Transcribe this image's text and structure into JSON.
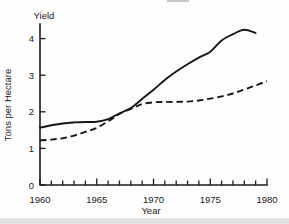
{
  "figure": {
    "background": "#fdfdfd",
    "bottom_strip_color": "#e3e3e3"
  },
  "chart_data": {
    "type": "line",
    "title": "Yield",
    "xlabel": "Year",
    "ylabel": "Tons per Hectare",
    "xlim": [
      1960,
      1980
    ],
    "ylim": [
      0,
      4.4
    ],
    "x_major_ticks": [
      1960,
      1965,
      1970,
      1975,
      1980
    ],
    "x_minor_tick_step": 1,
    "y_ticks": [
      0,
      1,
      2,
      3,
      4
    ],
    "grid": false,
    "legend": "none",
    "line_color": "#161616",
    "series": [
      {
        "name": "solid",
        "line_style": "solid",
        "points": [
          [
            1960,
            1.57
          ],
          [
            1961,
            1.63
          ],
          [
            1962,
            1.68
          ],
          [
            1963,
            1.71
          ],
          [
            1964,
            1.72
          ],
          [
            1965,
            1.73
          ],
          [
            1966,
            1.8
          ],
          [
            1967,
            1.96
          ],
          [
            1968,
            2.1
          ],
          [
            1969,
            2.35
          ],
          [
            1970,
            2.6
          ],
          [
            1971,
            2.87
          ],
          [
            1972,
            3.1
          ],
          [
            1973,
            3.3
          ],
          [
            1974,
            3.48
          ],
          [
            1975,
            3.64
          ],
          [
            1976,
            3.95
          ],
          [
            1977,
            4.12
          ],
          [
            1978,
            4.24
          ],
          [
            1979,
            4.15
          ]
        ]
      },
      {
        "name": "dashed",
        "line_style": "dashed",
        "points": [
          [
            1960,
            1.22
          ],
          [
            1961,
            1.24
          ],
          [
            1962,
            1.28
          ],
          [
            1963,
            1.35
          ],
          [
            1964,
            1.45
          ],
          [
            1965,
            1.56
          ],
          [
            1966,
            1.74
          ],
          [
            1967,
            1.94
          ],
          [
            1968,
            2.08
          ],
          [
            1969,
            2.21
          ],
          [
            1970,
            2.26
          ],
          [
            1971,
            2.27
          ],
          [
            1972,
            2.27
          ],
          [
            1973,
            2.28
          ],
          [
            1974,
            2.31
          ],
          [
            1975,
            2.36
          ],
          [
            1976,
            2.42
          ],
          [
            1977,
            2.5
          ],
          [
            1978,
            2.61
          ],
          [
            1979,
            2.72
          ],
          [
            1980,
            2.84
          ]
        ]
      }
    ]
  }
}
